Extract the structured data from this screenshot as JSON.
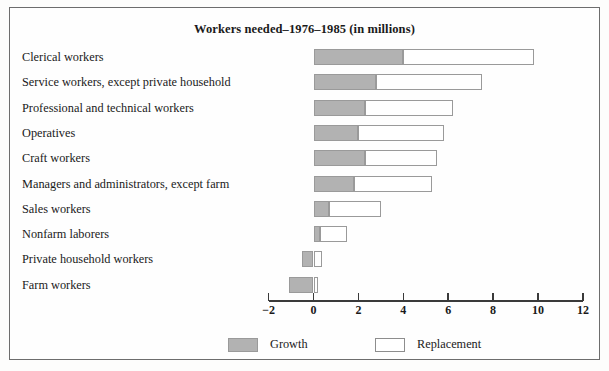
{
  "chart_data": {
    "type": "bar",
    "orientation": "horizontal",
    "stacked": true,
    "title": "Workers needed–1976–1985 (in millions)",
    "xlabel": "",
    "ylabel": "",
    "xlim": [
      -2,
      12
    ],
    "xticks": [
      -2,
      0,
      2,
      4,
      6,
      8,
      10,
      12
    ],
    "xtick_labels": [
      "−2",
      "0",
      "2",
      "4",
      "6",
      "8",
      "10",
      "12"
    ],
    "grid": false,
    "legend_position": "bottom",
    "categories": [
      "Clerical workers",
      "Service workers, except private household",
      "Professional and technical workers",
      "Operatives",
      "Craft workers",
      "Managers and administrators, except farm",
      "Sales workers",
      "Nonfarm laborers",
      "Private household workers",
      "Farm workers"
    ],
    "series": [
      {
        "name": "Growth",
        "color": "#b2b2b2",
        "values": [
          4.0,
          2.8,
          2.3,
          2.0,
          2.3,
          1.8,
          0.7,
          0.3,
          -0.5,
          -1.1
        ]
      },
      {
        "name": "Replacement",
        "color": "#ffffff",
        "values": [
          5.8,
          4.7,
          3.9,
          3.8,
          3.2,
          3.5,
          2.3,
          1.2,
          0.4,
          0.2
        ]
      }
    ],
    "totals": [
      9.8,
      7.5,
      6.2,
      5.8,
      5.5,
      5.3,
      3.0,
      1.5,
      0.4,
      0.2
    ]
  },
  "legend": {
    "items": [
      {
        "label": "Growth",
        "swatch": "growth"
      },
      {
        "label": "Replacement",
        "swatch": "replacement"
      }
    ]
  }
}
